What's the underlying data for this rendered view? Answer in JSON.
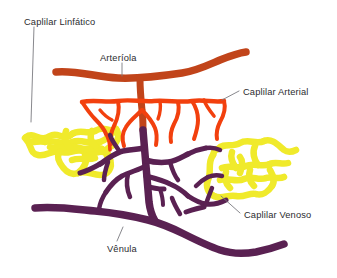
{
  "diagram": {
    "background_color": "#ffffff",
    "width": 337,
    "height": 278,
    "labels": {
      "lymphatic_capillary": "Caplilar Linfático",
      "arteriole": "Arteríola",
      "arterial_capillary": "Caplilar Arterial",
      "venous_capillary": "Caplilar Venoso",
      "venule": "Vênula"
    },
    "colors": {
      "arteriole": "#C1441A",
      "arterial_capillary": "#F2400E",
      "venule": "#5A2152",
      "venous_capillary": "#5A2152",
      "lymphatic_capillary": "#F0EA2B",
      "leader_line": "#7a7a80",
      "label_text": "#2b2b2f"
    },
    "legend_items": [
      {
        "name": "Caplilar Linfático",
        "color": "#F0EA2B"
      },
      {
        "name": "Arteríola",
        "color": "#C1441A"
      },
      {
        "name": "Caplilar Arterial",
        "color": "#F2400E"
      },
      {
        "name": "Caplilar Venoso",
        "color": "#5A2152"
      },
      {
        "name": "Vênula",
        "color": "#5A2152"
      }
    ]
  }
}
